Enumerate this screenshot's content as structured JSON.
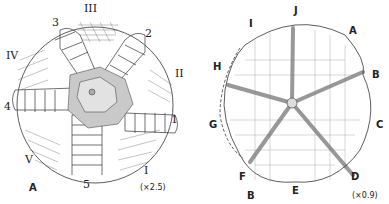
{
  "figures": [
    {
      "panel_label": "A",
      "scale": "(×2.5)",
      "ambulacra_labels": [
        "I",
        "II",
        "III",
        "IV",
        "V"
      ],
      "interambulacra_labels": [
        "1",
        "2",
        "3",
        "4",
        "5"
      ]
    },
    {
      "panel_label": "B",
      "scale": "(×0.9)",
      "perimeter_labels": [
        "A",
        "B",
        "C",
        "D",
        "E",
        "F",
        "G",
        "H",
        "I",
        "J"
      ]
    }
  ]
}
